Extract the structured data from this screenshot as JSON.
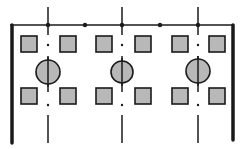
{
  "diagram": {
    "type": "structural-bay-plan",
    "width": 245,
    "height": 149,
    "colors": {
      "ink": "#1a1a1a",
      "fill": "#b8b8b8",
      "background": "#ffffff"
    },
    "top_beam": {
      "x1": 10,
      "x2": 234,
      "y": 25,
      "dots": [
        85,
        160
      ]
    },
    "walls": [
      {
        "name": "left",
        "x": 12,
        "y1": 25,
        "y2": 143,
        "stroke": 3.5
      },
      {
        "name": "right",
        "x": 233,
        "y1": 25,
        "y2": 140,
        "stroke": 3.5
      }
    ],
    "axes": [
      48,
      122,
      198
    ],
    "axis_top": 7,
    "axis_bottom": 143,
    "columns": [
      {
        "cx": 48,
        "cy": 72,
        "r": 12
      },
      {
        "cx": 122,
        "cy": 72,
        "r": 11
      },
      {
        "cx": 198,
        "cy": 71,
        "r": 12
      }
    ],
    "squares": {
      "size": 16,
      "top_row_y": 36,
      "bottom_row_y": 88,
      "xs": [
        21,
        60,
        96,
        135,
        172,
        209
      ]
    }
  }
}
